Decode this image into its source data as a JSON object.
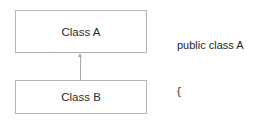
{
  "diagram": {
    "type": "uml-inheritance",
    "parent_class": {
      "label": "Class A"
    },
    "child_class": {
      "label": "Class B"
    },
    "relationship": {
      "from": "Class B",
      "to": "Class A",
      "kind": "inheritance-arrow"
    }
  },
  "code": {
    "lines": [
      "public class A",
      "{",
      "...",
      "}",
      "public class B : A",
      "{",
      "...",
      "}"
    ]
  },
  "colors": {
    "box_border": "#b4b4b4",
    "connector": "#a8a8a8",
    "text": "#2a2a2a",
    "background": "#ffffff"
  }
}
